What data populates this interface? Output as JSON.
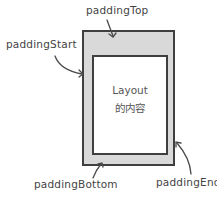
{
  "diagram": {
    "labels": {
      "top": "paddingTop",
      "start": "paddingStart",
      "bottom": "paddingBottom",
      "end": "paddingEnd"
    },
    "content": {
      "line1": "Layout",
      "line2": "的内容"
    },
    "colors": {
      "padding_fill": "#d9d9d9",
      "content_fill": "#ffffff",
      "border": "#3f3f3f"
    }
  }
}
